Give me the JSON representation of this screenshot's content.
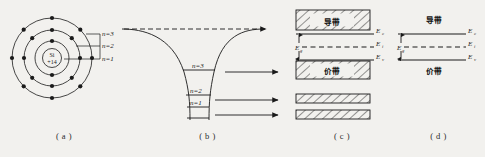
{
  "figure": {
    "background_color": "#f2f1ee",
    "ink_color": "#1a1a1a"
  },
  "panel_a": {
    "caption": "( a )",
    "nucleus_element": "Si",
    "nucleus_charge": "+14",
    "shell_labels": [
      "n=3",
      "n=2",
      "n=1"
    ],
    "shell_electron_counts": [
      8,
      8,
      2
    ],
    "shell_count": 3
  },
  "panel_b": {
    "caption": "( b )",
    "level_labels": [
      "n=3",
      "n=2",
      "n=1"
    ],
    "arrow_count": 4,
    "dashed_arrow_count": 1
  },
  "panel_c": {
    "caption": "( c )",
    "conduction_band_label": "导带",
    "valence_band_label": "价带",
    "gap_label": "E",
    "gap_label_sub": "g",
    "levels": [
      {
        "label": "E",
        "sub": "c"
      },
      {
        "label": "E",
        "sub": "i"
      },
      {
        "label": "E",
        "sub": "v"
      }
    ],
    "extra_hatched_bars": 2
  },
  "panel_d": {
    "caption": "( d )",
    "conduction_band_label": "导带",
    "valence_band_label": "价带",
    "gap_label": "E",
    "gap_label_sub": "g",
    "levels": [
      {
        "label": "E",
        "sub": "c"
      },
      {
        "label": "E",
        "sub": "i"
      },
      {
        "label": "E",
        "sub": "v"
      }
    ]
  }
}
